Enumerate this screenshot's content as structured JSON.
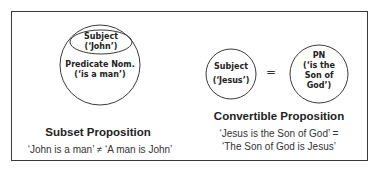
{
  "subset": {
    "inner_ellipse": {
      "line1": "Subject",
      "line2": "(‘John’)"
    },
    "outer_circle": {
      "line1": "Predicate Nom.",
      "line2": "(‘is a man’)"
    },
    "title": "Subset Proposition",
    "caption": "‘John is a man’ ≠ ‘A man is John’"
  },
  "convertible": {
    "left_circle": {
      "line1": "Subject",
      "line2": "(‘Jesus’)"
    },
    "equals": "=",
    "right_circle": {
      "line1": "PN",
      "line2": "(‘is the",
      "line3": "Son of",
      "line4": "God’)"
    },
    "title": "Convertible Proposition",
    "caption_line1": "‘Jesus is the Son of God’ =",
    "caption_line2": "‘The Son of God is Jesus’"
  },
  "colors": {
    "stroke": "#3a3a3a",
    "text": "#222222",
    "background": "#ffffff"
  }
}
